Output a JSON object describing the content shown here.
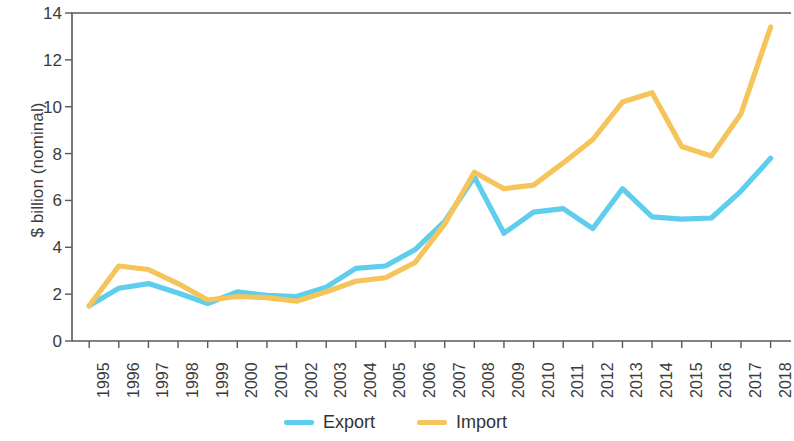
{
  "chart_data": {
    "type": "line",
    "title": "",
    "xlabel": "",
    "ylabel": "$ billion (nominal)",
    "categories": [
      "1995",
      "1996",
      "1997",
      "1998",
      "1999",
      "2000",
      "2001",
      "2002",
      "2003",
      "2004",
      "2005",
      "2006",
      "2007",
      "2008",
      "2009",
      "2010",
      "2011",
      "2012",
      "2013",
      "2014",
      "2015",
      "2016",
      "2017",
      "2018"
    ],
    "x": [
      1995,
      1996,
      1997,
      1998,
      1999,
      2000,
      2001,
      2002,
      2003,
      2004,
      2005,
      2006,
      2007,
      2008,
      2009,
      2010,
      2011,
      2012,
      2013,
      2014,
      2015,
      2016,
      2017,
      2018
    ],
    "series": [
      {
        "name": "Export",
        "color": "#5FCDEE",
        "values": [
          1.5,
          2.25,
          2.45,
          2.05,
          1.6,
          2.1,
          1.95,
          1.9,
          2.3,
          3.1,
          3.2,
          3.9,
          5.1,
          7.0,
          4.6,
          5.5,
          5.65,
          4.8,
          6.5,
          5.3,
          5.2,
          5.25,
          6.4,
          7.8
        ]
      },
      {
        "name": "Import",
        "color": "#F5C45A",
        "values": [
          1.5,
          3.2,
          3.05,
          2.45,
          1.75,
          1.9,
          1.85,
          1.7,
          2.1,
          2.55,
          2.7,
          3.35,
          5.0,
          7.2,
          6.5,
          6.65,
          7.6,
          8.6,
          10.2,
          10.6,
          8.3,
          7.9,
          9.7,
          13.4
        ]
      }
    ],
    "ylim": [
      0,
      14
    ],
    "yticks": [
      0,
      2,
      4,
      6,
      8,
      10,
      12,
      14
    ],
    "grid": false,
    "legend_position": "bottom"
  },
  "legend": {
    "items": [
      {
        "label": "Export",
        "color": "#5FCDEE"
      },
      {
        "label": "Import",
        "color": "#F5C45A"
      }
    ]
  },
  "axes": {
    "y_axis_label": "$ billion (nominal)",
    "y_tick_labels": [
      "14",
      "12",
      "10",
      "8",
      "6",
      "4",
      "2",
      "0"
    ],
    "x_tick_labels": [
      "1995",
      "1996",
      "1997",
      "1998",
      "1999",
      "2000",
      "2001",
      "2002",
      "2003",
      "2004",
      "2005",
      "2006",
      "2007",
      "2008",
      "2009",
      "2010",
      "2011",
      "2012",
      "2013",
      "2014",
      "2015",
      "2016",
      "2017",
      "2018"
    ],
    "axis_color": "#595959"
  }
}
